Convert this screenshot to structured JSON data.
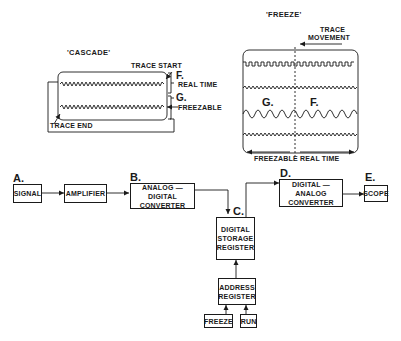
{
  "cascade": {
    "title": "'CASCADE'",
    "trace_start": "TRACE START",
    "trace_end": "TRACE END",
    "f_letter": "F.",
    "f_label": "REAL TIME",
    "g_letter": "G.",
    "g_label": "FREEZABLE"
  },
  "freeze": {
    "title": "'FREEZE'",
    "trace_movement_line1": "TRACE",
    "trace_movement_line2": "MOVEMENT",
    "g_letter": "G.",
    "f_letter": "F.",
    "bottom_left": "FREEZABLE",
    "bottom_right": "REAL TIME"
  },
  "blocks": {
    "signal": {
      "letter": "A.",
      "label": "SIGNAL"
    },
    "amplifier": {
      "label": "AMPLIFIER"
    },
    "adc": {
      "letter": "B.",
      "line1": "ANALOG — DIGITAL",
      "line2": "CONVERTER"
    },
    "storage": {
      "letter": "C.",
      "line1": "DIGITAL",
      "line2": "STORAGE",
      "line3": "REGISTER"
    },
    "dac": {
      "letter": "D.",
      "line1": "DIGITAL — ANALOG",
      "line2": "CONVERTER"
    },
    "scope": {
      "letter": "E.",
      "label": "SCOPE"
    },
    "address": {
      "line1": "ADDRESS",
      "line2": "REGISTER"
    },
    "freeze_btn": {
      "label": "FREEZE"
    },
    "run_btn": {
      "label": "RUN"
    }
  },
  "colors": {
    "ink": "#1a1a1a",
    "background": "#ffffff"
  }
}
